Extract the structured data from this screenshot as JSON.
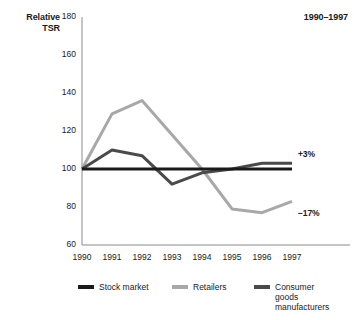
{
  "chart_data": {
    "type": "line",
    "title": "1990–1997",
    "ylabel": "Relative\nTSR",
    "ylabel_lines": [
      "Relative",
      "TSR"
    ],
    "xlabel": "",
    "x": [
      1990,
      1991,
      1992,
      1993,
      1994,
      1995,
      1996,
      1997
    ],
    "categories": [
      "1990",
      "1991",
      "1992",
      "1993",
      "1994",
      "1995",
      "1996",
      "1997"
    ],
    "ylim": [
      60,
      180
    ],
    "yticks": [
      60,
      80,
      100,
      120,
      140,
      160,
      180
    ],
    "ytick_labels": [
      "60",
      "80",
      "100",
      "120",
      "140",
      "160",
      "180"
    ],
    "grid": false,
    "legend_position": "bottom",
    "series": [
      {
        "name": "Stock market",
        "color": "#1a1a1a",
        "values": [
          100,
          100,
          100,
          100,
          100,
          100,
          100,
          100
        ]
      },
      {
        "name": "Retailers",
        "color": "#a8a8a8",
        "values": [
          100,
          129,
          136,
          118,
          100,
          79,
          77,
          83
        ]
      },
      {
        "name": "Consumer goods manufacturers",
        "color": "#4a4a4a",
        "values": [
          100,
          110,
          107,
          92,
          98,
          100,
          103,
          103
        ]
      }
    ],
    "annotations": [
      {
        "text": "+3%",
        "series": "Consumer goods manufacturers",
        "at_x": 1997,
        "value": 103
      },
      {
        "text": "−17%",
        "series": "Retailers",
        "at_x": 1997,
        "value": 83
      }
    ]
  },
  "legend": {
    "items": [
      {
        "label": "Stock market",
        "color": "#1a1a1a"
      },
      {
        "label": "Retailers",
        "color": "#a8a8a8"
      },
      {
        "label": "Consumer\ngoods\nmanufacturers",
        "color": "#4a4a4a"
      }
    ]
  }
}
